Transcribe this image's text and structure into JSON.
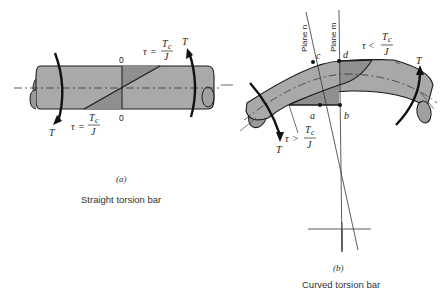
{
  "figure_a": {
    "tag": "(a)",
    "caption": "Straight torsion bar",
    "torque_left": "T",
    "torque_right": "T",
    "zero_top": "0",
    "zero_bottom": "0",
    "stress_top": {
      "tau": "τ",
      "rel": "=",
      "num": "Tc",
      "num_base": "T",
      "num_sub": "c",
      "den": "J"
    },
    "stress_bottom": {
      "tau": "τ",
      "rel": "=",
      "num_base": "T",
      "num_sub": "c",
      "den": "J"
    }
  },
  "figure_b": {
    "tag": "(b)",
    "caption": "Curved torsion bar",
    "torque_left": "T",
    "torque_right": "T",
    "plane_n": "Plane n",
    "plane_m": "Plane m",
    "point_a": "a",
    "point_b": "b",
    "point_c": "c",
    "point_d": "d",
    "stress_outer": {
      "tau": "τ",
      "rel": "<",
      "num_base": "T",
      "num_sub": "c",
      "den": "J"
    },
    "stress_inner": {
      "tau": "τ",
      "rel": ">",
      "num_base": "T",
      "num_sub": "c",
      "den": "J"
    }
  },
  "colors": {
    "bar_fill": "#a9a9a9",
    "bar_shade": "#8f8f8f",
    "stroke": "#1a1a1a",
    "thin_line": "#444444"
  }
}
